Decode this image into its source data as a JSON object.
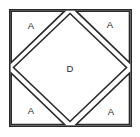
{
  "figure": {
    "background_color": "#ffffff",
    "stroke_color": "#2b2b2b",
    "fill_color": "#ffffff",
    "outer_square": {
      "name": "outer-square",
      "left": 9,
      "top": 9,
      "right": 131,
      "bottom": 126
    },
    "labels": {
      "corner_top_left": "A",
      "corner_top_right": "A",
      "corner_bottom_left": "A",
      "corner_bottom_right": "A",
      "center_diamond": "D"
    },
    "label_positions": {
      "corner_top_left": {
        "x": 31,
        "y": 26
      },
      "corner_top_right": {
        "x": 110,
        "y": 25
      },
      "corner_bottom_left": {
        "x": 31,
        "y": 111
      },
      "corner_bottom_right": {
        "x": 111,
        "y": 112
      },
      "center_diamond": {
        "x": 70,
        "y": 69
      }
    },
    "shapes": {
      "diamond_points": "70,13 127,67.5 70,122 13,67.5",
      "triangle_top_left_points": "11,11 64,11 11,64",
      "triangle_top_right_points": "129,11 129,64 76,11",
      "triangle_bottom_left_points": "11,124 11,71 64,124",
      "triangle_bottom_right_points": "129,124 76,124 129,71"
    }
  }
}
